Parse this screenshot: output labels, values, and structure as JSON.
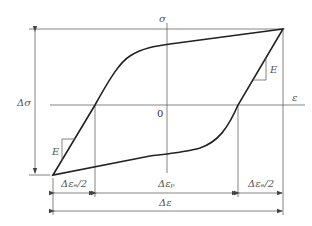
{
  "diagram": {
    "axes": {
      "y_label": "σ",
      "x_label": "ε",
      "origin_label": "0"
    },
    "labels": {
      "stress_range": "Δσ",
      "modulus_upper": "E",
      "modulus_lower": "E"
    },
    "dimensions": {
      "elastic_half_left": "Δεₑ/2",
      "plastic": "Δεₚ",
      "elastic_half_right": "Δεₑ/2",
      "total": "Δε"
    },
    "colors": {
      "curve": "#222222",
      "guides": "#666666",
      "text": "#555555"
    }
  }
}
